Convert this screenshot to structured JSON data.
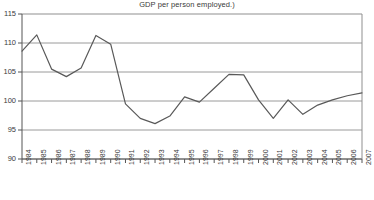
{
  "chart_data": {
    "type": "line",
    "title": "GDP per person employed.)",
    "xlabel": "",
    "ylabel": "",
    "grid": true,
    "legend": "none",
    "xlim": [
      1984,
      2007
    ],
    "ylim": [
      90,
      115
    ],
    "ytick_labels": [
      "115",
      "110",
      "105",
      "100",
      "95",
      "90"
    ],
    "ytick_values": [
      115,
      110,
      105,
      100,
      95,
      90
    ],
    "categories": [
      "1984",
      "1985",
      "1986",
      "1987",
      "1988",
      "1989",
      "1990",
      "1991",
      "1992",
      "1993",
      "1994",
      "1995",
      "1996",
      "1997",
      "1998",
      "1999",
      "2000",
      "2001",
      "2002",
      "2003",
      "2004",
      "2005",
      "2006",
      "2007"
    ],
    "x": [
      1984,
      1985,
      1986,
      1987,
      1988,
      1989,
      1990,
      1991,
      1992,
      1993,
      1994,
      1995,
      1996,
      1997,
      1998,
      1999,
      2000,
      2001,
      2002,
      2003,
      2004,
      2005,
      2006,
      2007
    ],
    "values": [
      108.6,
      111.4,
      105.5,
      104.2,
      105.7,
      111.3,
      109.8,
      99.5,
      97.0,
      96.1,
      97.4,
      100.7,
      99.8,
      102.2,
      104.6,
      104.5,
      100.2,
      97.0,
      100.2,
      97.7,
      99.3,
      100.2,
      100.9,
      101.4
    ],
    "series": [
      {
        "name": "GDP per person employed",
        "color": "#595959",
        "values": [
          108.6,
          111.4,
          105.5,
          104.2,
          105.7,
          111.3,
          109.8,
          99.5,
          97.0,
          96.1,
          97.4,
          100.7,
          99.8,
          102.2,
          104.6,
          104.5,
          100.2,
          97.0,
          100.2,
          97.7,
          99.3,
          100.2,
          100.9,
          101.4
        ]
      }
    ],
    "colors": {
      "line": "#595959",
      "grid": "#9a9a9a",
      "axis": "#555555",
      "background": "#ffffff",
      "text": "#3a3a3a"
    }
  }
}
